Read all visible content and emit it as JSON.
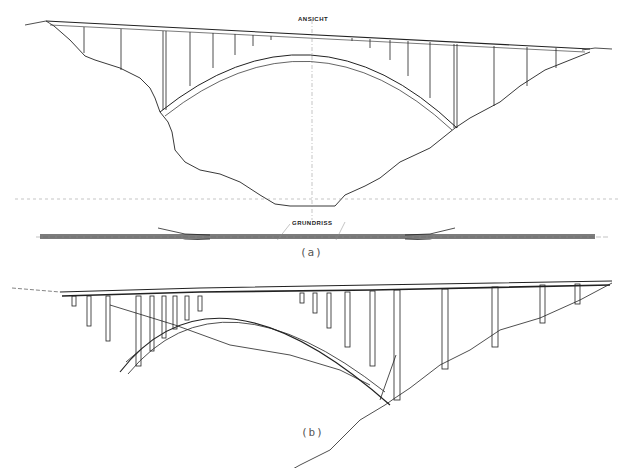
{
  "figure": {
    "panels": [
      {
        "id": "a",
        "caption": "(a)",
        "views": [
          {
            "name": "elevation",
            "label": "ANSICHT"
          },
          {
            "name": "plan",
            "label": "GRUNDRISS"
          }
        ]
      },
      {
        "id": "b",
        "caption": "(b)"
      }
    ]
  },
  "colors": {
    "line": "#222222",
    "faint": "#888888",
    "background": "#ffffff"
  }
}
